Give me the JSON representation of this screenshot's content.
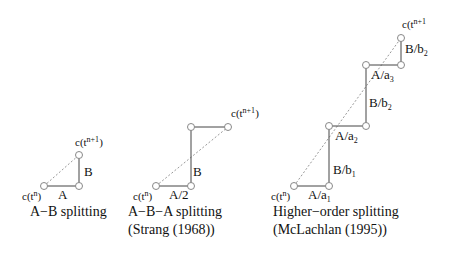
{
  "diagrams": [
    {
      "id": "ab",
      "caption_line1": "A−B splitting",
      "caption_line2": "",
      "start_label": "c(t",
      "start_sup": "n",
      "end_label": "c(t",
      "end_sup": "n+1",
      "steps": [
        {
          "label": "A",
          "sub": ""
        },
        {
          "label": "B",
          "sub": ""
        }
      ]
    },
    {
      "id": "aba",
      "caption_line1": "A−B−A splitting",
      "caption_line2": "(Strang (1968))",
      "start_label": "c(t",
      "start_sup": "n",
      "end_label": "c(t",
      "end_sup": "n+1",
      "steps": [
        {
          "label": "A/2",
          "sub": ""
        },
        {
          "label": "B",
          "sub": ""
        }
      ]
    },
    {
      "id": "higher",
      "caption_line1": "Higher−order splitting",
      "caption_line2": "(McLachlan (1995))",
      "start_label": "c(t",
      "start_sup": "n",
      "end_label": "c(t",
      "end_sup": "n+1",
      "steps": [
        {
          "label": "A/a",
          "sub": "1"
        },
        {
          "label": "B/b",
          "sub": "1"
        },
        {
          "label": "A/a",
          "sub": "2"
        },
        {
          "label": "B/b",
          "sub": "2"
        },
        {
          "label": "A/a",
          "sub": "3"
        },
        {
          "label": "B/b",
          "sub": "2"
        }
      ]
    }
  ]
}
